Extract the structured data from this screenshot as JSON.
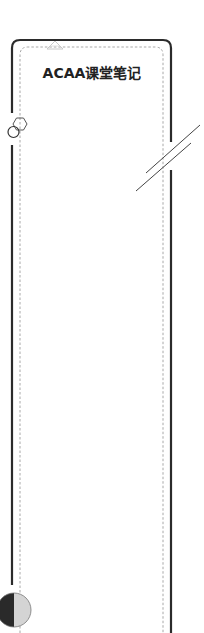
{
  "cover": {
    "title": "ACAA课堂笔记",
    "colors": {
      "outer_border": "#2b2b2b",
      "inner_dashed_border": "#a8a8a8",
      "title_text": "#222222",
      "half_circle_dark": "#2a2a2a",
      "half_circle_light": "#d4d4d4",
      "decoration_stroke": "#555555",
      "triangle_stroke": "#c8c8c8"
    },
    "decorations": {
      "top_triangle": "triangle-outline-icon",
      "left_shapes": [
        "hexagon-outline-icon",
        "circle-outline-icon"
      ],
      "right_shapes": [
        "double-slash-lines"
      ],
      "bottom_left": "half-filled-circle-icon"
    }
  }
}
